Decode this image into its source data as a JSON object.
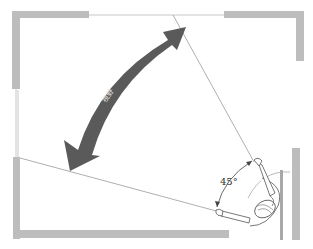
{
  "diagram": {
    "title": "",
    "angle_label": "45°",
    "arrow_label": "視野",
    "colors": {
      "wall": "#bdbdbd",
      "arrow": "#5a5a5a",
      "ray": "#9a9a9a",
      "background": "#ffffff"
    },
    "elements": [
      {
        "name": "room-walls",
        "description": "Top-down room outline with gray wall segments and openings"
      },
      {
        "name": "field-of-view-arrow",
        "description": "Large curved double-headed dark gray arrow spanning the view cone"
      },
      {
        "name": "view-rays",
        "description": "Two thin lines radiating from person to the top wall and left wall"
      },
      {
        "name": "angle-marker",
        "description": "Small double-headed arc marking a 45 degree angle near the person"
      },
      {
        "name": "person-figure",
        "description": "Top-down view of a person with arms extended, seated in the lower-right corner"
      }
    ]
  }
}
